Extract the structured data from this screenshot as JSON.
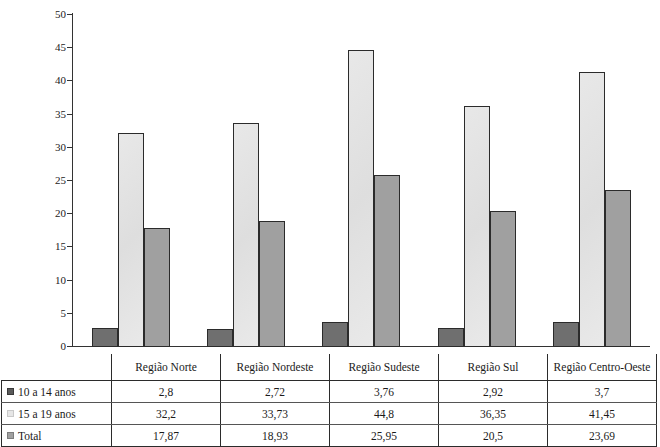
{
  "chart_data": {
    "type": "bar",
    "title": "",
    "xlabel": "",
    "ylabel": "",
    "ylim": [
      0,
      50
    ],
    "ytick_step": 5,
    "yticks": [
      "50",
      "45",
      "40",
      "35",
      "30",
      "25",
      "20",
      "15",
      "10",
      "5",
      "0"
    ],
    "grid": false,
    "legend_position": "table-row-headers",
    "categories": [
      "Região Norte",
      "Região Nordeste",
      "Região Sudeste",
      "Região Sul",
      "Região Centro-Oeste"
    ],
    "series": [
      {
        "name": "10 a 14 anos",
        "color": "#6f6f6f",
        "swatch": "s0",
        "values": [
          2.8,
          2.72,
          3.76,
          2.92,
          3.7
        ],
        "labels": [
          "2,8",
          "2,72",
          "3,76",
          "2,92",
          "3,7"
        ]
      },
      {
        "name": "15 a 19 anos",
        "color": "#e6e6e6",
        "swatch": "s1",
        "values": [
          32.2,
          33.73,
          44.8,
          36.35,
          41.45
        ],
        "labels": [
          "32,2",
          "33,73",
          "44,8",
          "36,35",
          "41,45"
        ]
      },
      {
        "name": "Total",
        "color": "#a0a0a0",
        "swatch": "s2",
        "values": [
          17.87,
          18.93,
          25.95,
          20.5,
          23.69
        ],
        "labels": [
          "17,87",
          "18,93",
          "25,95",
          "20,5",
          "23,69"
        ]
      }
    ]
  },
  "table": {
    "header_blank": "",
    "column_headers": [
      "Região Norte",
      "Região Nordeste",
      "Região Sudeste",
      "Região Sul",
      "Região Centro-Oeste"
    ],
    "rows": [
      {
        "label": "10 a 14 anos",
        "swatch": "s0",
        "values": [
          "2,8",
          "2,72",
          "3,76",
          "2,92",
          "3,7"
        ]
      },
      {
        "label": "15 a 19 anos",
        "swatch": "s1",
        "values": [
          "32,2",
          "33,73",
          "44,8",
          "36,35",
          "41,45"
        ]
      },
      {
        "label": "Total",
        "swatch": "s2",
        "values": [
          "17,87",
          "18,93",
          "25,95",
          "20,5",
          "23,69"
        ]
      }
    ]
  },
  "colors": {
    "series_10_14": "#6f6f6f",
    "series_15_19": "#e6e6e6",
    "series_total": "#a0a0a0",
    "axis": "#333333",
    "bar_outline": "#2b2b2b"
  }
}
